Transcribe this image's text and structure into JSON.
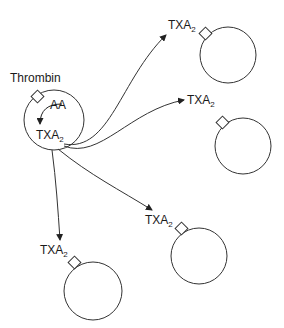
{
  "diagram": {
    "type": "thromboxane signaling diagram",
    "source_cell": {
      "stimulus_label": "Thrombin",
      "substrate_label": "AA",
      "product_label": "TXA",
      "product_subscript": "2"
    },
    "target_cells": [
      {
        "id": "top-right",
        "label": "TXA",
        "subscript": "2"
      },
      {
        "id": "right",
        "label": "TXA",
        "subscript": "2"
      },
      {
        "id": "lower-middle",
        "label": "TXA",
        "subscript": "2"
      },
      {
        "id": "lower-left",
        "label": "TXA",
        "subscript": "2"
      }
    ],
    "colors": {
      "stroke": "#333333",
      "text": "#1a1a1a",
      "background": "#ffffff"
    }
  }
}
